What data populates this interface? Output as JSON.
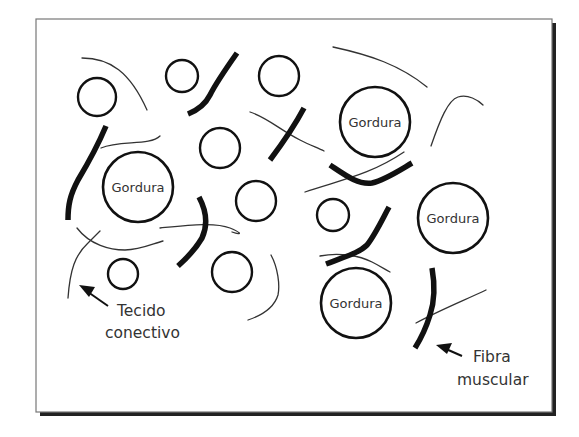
{
  "diagram": {
    "fat_cell_label": "Gordura",
    "labels": {
      "connective_tissue_line1": "Tecido",
      "connective_tissue_line2": "conectivo",
      "muscle_fiber_line1": "Fibra",
      "muscle_fiber_line2": "muscular"
    },
    "fat_cells_labeled": [
      {
        "label": "Gordura",
        "cx": 375,
        "cy": 122,
        "r": 35
      },
      {
        "label": "Gordura",
        "cx": 138,
        "cy": 187,
        "r": 35
      },
      {
        "label": "Gordura",
        "cx": 453,
        "cy": 218,
        "r": 35
      },
      {
        "label": "Gordura",
        "cx": 356,
        "cy": 303,
        "r": 35
      }
    ],
    "fat_cells_small_count": 9,
    "colors": {
      "ink": "#111111",
      "text": "#333333",
      "frame_border": "#777777",
      "shadow": "#222222",
      "background": "#ffffff"
    }
  }
}
